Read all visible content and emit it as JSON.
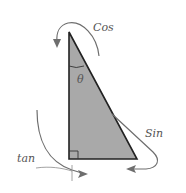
{
  "diagram": {
    "labels": {
      "angle": "θ",
      "cos": "Cos",
      "sin": "Sin",
      "tan": "tan"
    },
    "colors": {
      "triangle_fill": "#a9a9a9",
      "triangle_stroke": "#222222",
      "arrow_stroke": "#6e6e6e",
      "label_color": "#555555",
      "background": "#ffffff"
    }
  }
}
